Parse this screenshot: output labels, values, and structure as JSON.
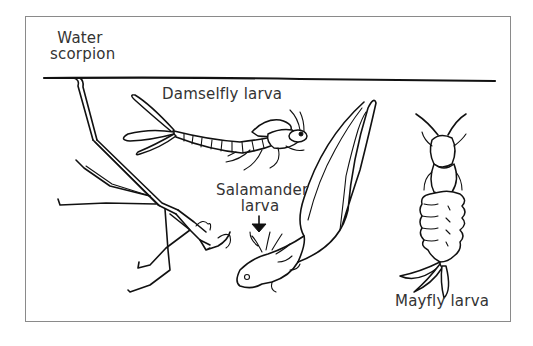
{
  "figure": {
    "type": "pond-life-illustration",
    "water_surface": {
      "visible": true
    },
    "labels": {
      "water_scorpion": [
        "Water",
        "scorpion"
      ],
      "damselfly_larva": "Damselfly larva",
      "salamander_larva": [
        "Salamander",
        "larva"
      ],
      "mayfly_larva": "Mayfly larva"
    },
    "pointer": {
      "icon": "down-arrow-icon",
      "target": "salamander_larva"
    },
    "colors": {
      "ink": "#111111",
      "label_text": "#333333",
      "frame_border": "#8a8a8a",
      "background": "#ffffff"
    }
  }
}
